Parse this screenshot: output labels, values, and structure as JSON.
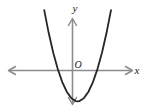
{
  "figure": {
    "kind": "coordinate-plane-graph",
    "width": 148,
    "height": 112,
    "background_color": "#ffffff"
  },
  "labels": {
    "x_axis": "x",
    "y_axis": "y",
    "origin": "O"
  },
  "colors": {
    "axis": "#8c8c8c",
    "curve": "#262626",
    "text": "#1a1a1a",
    "background": "#ffffff"
  },
  "chart_data": {
    "type": "line",
    "title": "",
    "subtitle": "",
    "xlabel": "x",
    "ylabel": "y",
    "annotations": [
      "O"
    ],
    "legend": [],
    "legend_position": "none",
    "grid": false,
    "tick_labels": {
      "x": [],
      "y": []
    },
    "axes": {
      "x_axis_arrows": "both",
      "y_axis_arrows": "both",
      "origin_label": "O",
      "xlim": [
        -4.3,
        3.9
      ],
      "ylim": [
        -1.4,
        2.8
      ]
    },
    "series": [
      {
        "name": "parabola",
        "kind": "quadratic",
        "description": "upward-opening parabola with vertex below the x-axis, two x-intercepts straddling the origin",
        "equation": "y = a(x - h)^2 + k, a > 0",
        "vertex": [
          0.0,
          -1.0
        ],
        "x_intercepts": [
          -1.0,
          1.0
        ],
        "y_intercept": -1.0,
        "opens": "up",
        "x": [
          -1.85,
          -1.6,
          -1.35,
          -1.1,
          -0.85,
          -0.6,
          -0.35,
          -0.1,
          0.0,
          0.1,
          0.35,
          0.6,
          0.85,
          1.1,
          1.35,
          1.6,
          1.85
        ],
        "y": [
          2.42,
          1.56,
          0.82,
          0.21,
          -0.28,
          -0.64,
          -0.88,
          -0.99,
          -1.0,
          -0.99,
          -0.88,
          -0.64,
          -0.28,
          0.21,
          0.82,
          1.56,
          2.42
        ]
      }
    ]
  }
}
